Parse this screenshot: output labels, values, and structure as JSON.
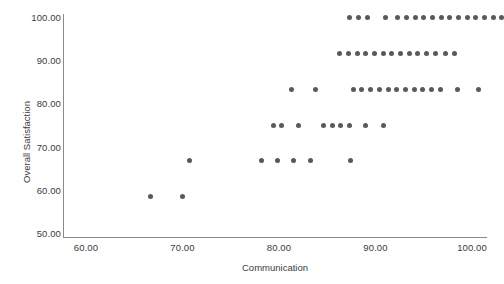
{
  "chart_data": {
    "type": "scatter",
    "title": "",
    "xlabel": "Communication",
    "ylabel": "Overall Satisfaction",
    "xlim": [
      57.4,
      102.5
    ],
    "ylim": [
      48.0,
      101.5
    ],
    "xticks": [
      "60.00",
      "70.00",
      "80.00",
      "90.00",
      "100.00"
    ],
    "xtick_values": [
      60,
      70,
      80,
      90,
      100
    ],
    "yticks": [
      "50.00",
      "60.00",
      "70.00",
      "80.00",
      "90.00",
      "100.00"
    ],
    "ytick_values": [
      50,
      60,
      70,
      80,
      90,
      100
    ],
    "grid": false,
    "legend": null,
    "marker_color": "#59595c",
    "axis_color": "#8a8a8a",
    "points": [
      [
        66.7,
        58.33
      ],
      [
        70.0,
        58.33
      ],
      [
        70.7,
        66.67
      ],
      [
        78.2,
        66.67
      ],
      [
        79.8,
        66.67
      ],
      [
        81.5,
        66.67
      ],
      [
        83.3,
        66.67
      ],
      [
        87.4,
        66.67
      ],
      [
        79.4,
        75.0
      ],
      [
        80.3,
        75.0
      ],
      [
        82.0,
        75.0
      ],
      [
        84.6,
        75.0
      ],
      [
        85.5,
        75.0
      ],
      [
        86.4,
        75.0
      ],
      [
        87.3,
        75.0
      ],
      [
        89.0,
        75.0
      ],
      [
        90.8,
        75.0
      ],
      [
        81.3,
        83.33
      ],
      [
        83.8,
        83.33
      ],
      [
        87.7,
        83.33
      ],
      [
        88.6,
        83.33
      ],
      [
        89.5,
        83.33
      ],
      [
        90.4,
        83.33
      ],
      [
        91.3,
        83.33
      ],
      [
        92.2,
        83.33
      ],
      [
        93.1,
        83.33
      ],
      [
        94.0,
        83.33
      ],
      [
        94.9,
        83.33
      ],
      [
        95.8,
        83.33
      ],
      [
        96.7,
        83.33
      ],
      [
        98.5,
        83.33
      ],
      [
        100.7,
        83.33
      ],
      [
        86.3,
        91.67
      ],
      [
        87.2,
        91.67
      ],
      [
        88.1,
        91.67
      ],
      [
        89.0,
        91.67
      ],
      [
        89.9,
        91.67
      ],
      [
        90.8,
        91.67
      ],
      [
        91.7,
        91.67
      ],
      [
        92.6,
        91.67
      ],
      [
        93.5,
        91.67
      ],
      [
        94.4,
        91.67
      ],
      [
        95.3,
        91.67
      ],
      [
        96.2,
        91.67
      ],
      [
        97.3,
        91.67
      ],
      [
        98.2,
        91.67
      ],
      [
        87.3,
        100.0
      ],
      [
        88.2,
        100.0
      ],
      [
        89.2,
        100.0
      ],
      [
        91.0,
        100.0
      ],
      [
        92.3,
        100.0
      ],
      [
        93.2,
        100.0
      ],
      [
        94.1,
        100.0
      ],
      [
        95.0,
        100.0
      ],
      [
        95.9,
        100.0
      ],
      [
        96.8,
        100.0
      ],
      [
        97.7,
        100.0
      ],
      [
        98.6,
        100.0
      ],
      [
        99.5,
        100.0
      ],
      [
        100.4,
        100.0
      ],
      [
        101.3,
        100.0
      ],
      [
        102.2,
        100.0
      ],
      [
        103.1,
        100.0
      ]
    ]
  }
}
